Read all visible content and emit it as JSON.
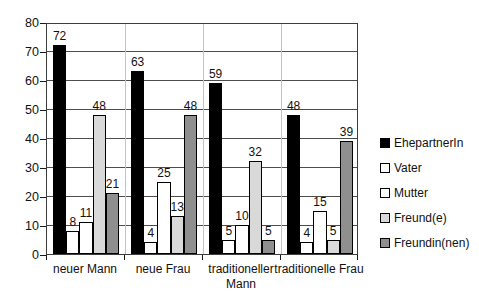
{
  "chart_data": {
    "type": "bar",
    "title": "",
    "xlabel": "",
    "ylabel": "",
    "categories": [
      "neuer Mann",
      "neue Frau",
      "traditioneller Mann",
      "traditionelle Frau"
    ],
    "series": [
      {
        "name": "EhepartnerIn",
        "color": "#000000",
        "values": [
          72,
          63,
          59,
          48
        ]
      },
      {
        "name": "Vater",
        "color": "#ffffff",
        "values": [
          8,
          4,
          5,
          4
        ]
      },
      {
        "name": "Mutter",
        "color": "#ffffff",
        "values": [
          11,
          25,
          10,
          15
        ]
      },
      {
        "name": "Freund(e)",
        "color": "#d9d9d9",
        "values": [
          48,
          13,
          32,
          5
        ]
      },
      {
        "name": "Freundin(nen)",
        "color": "#8f8f8f",
        "values": [
          21,
          48,
          5,
          39
        ]
      }
    ],
    "ylim": [
      0,
      80
    ],
    "ytick_step": 10,
    "ytick_labels": [
      "0",
      "10",
      "20",
      "30",
      "40",
      "50",
      "60",
      "70",
      "80"
    ],
    "grid": "horizontal",
    "legend_position": "right",
    "value_labels_shown": true
  }
}
